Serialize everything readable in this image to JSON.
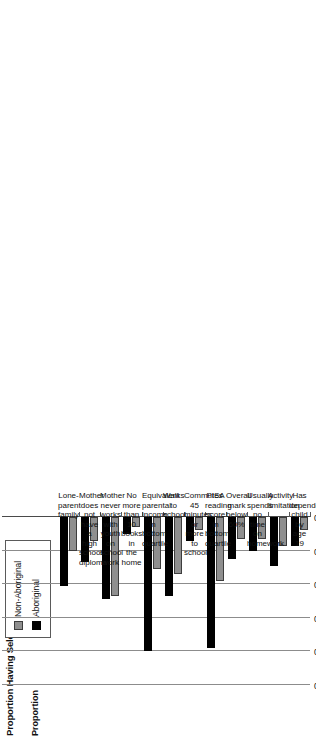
{
  "figure": {
    "title": "Proportion Having Select Characteristics",
    "axis_title": "Proportion"
  },
  "legend": {
    "position": "top-left",
    "entries": [
      {
        "label": "Non-Aboriginal",
        "color": "#8f8f8f"
      },
      {
        "label": "Aboriginal",
        "color": "#000000"
      }
    ]
  },
  "chart_data": {
    "type": "bar",
    "orientation": "vertical-rotated",
    "title": "Proportion Having Select Characteristics",
    "xlabel": "",
    "ylabel": "Proportion",
    "ylim": [
      0.0,
      0.5
    ],
    "ticks": [
      "0.00",
      "0.10",
      "0.20",
      "0.30",
      "0.40",
      "0.50"
    ],
    "tick_values": [
      0.0,
      0.1,
      0.2,
      0.3,
      0.4,
      0.5
    ],
    "grid": true,
    "categories": [
      "Lone-\nparent\nfamily",
      "Mother\ndoes not\nhave a high\nschool\ndiploma",
      "Mother\nnever works\nwith youth\non school\nwork",
      "No more\nthan 10\nbooks in\nthe home",
      "Equivalent\nparental\nincome in\nbottom\nquartile",
      "Walks to\nschool",
      "Commutes\n45 minutes\nor more to\nschool",
      "PISA\nreading\nscore in\nbottom\nquartile",
      "Overall\nmark\nbelow\n60%",
      "Usually\nspends no\ntime on\nhomework",
      "Activity\nlimitation",
      "Has\ndependent\nchild by\nage 19"
    ],
    "series": [
      {
        "name": "Non-Aboriginal",
        "color": "#8f8f8f",
        "values": [
          0.1,
          0.07,
          0.235,
          0.03,
          0.155,
          0.17,
          0.04,
          0.19,
          0.065,
          0.065,
          0.085,
          0.04
        ]
      },
      {
        "name": "Aboriginal",
        "color": "#000000",
        "values": [
          0.205,
          0.135,
          0.245,
          0.05,
          0.4,
          0.235,
          0.07,
          0.39,
          0.125,
          0.1,
          0.145,
          0.085
        ]
      }
    ]
  }
}
